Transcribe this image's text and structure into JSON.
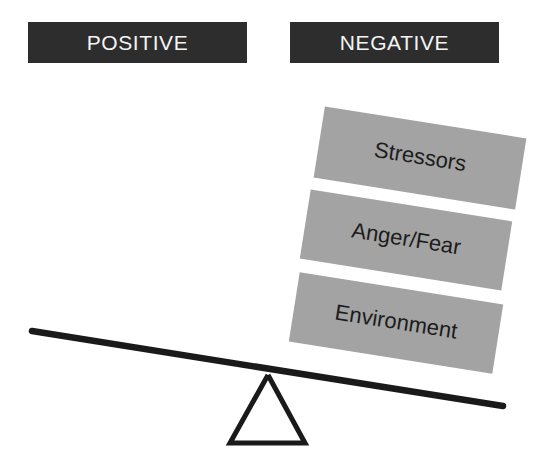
{
  "diagram": {
    "background_color": "#ffffff"
  },
  "headers": [
    {
      "id": "positive",
      "label": "POSITIVE",
      "background_color": "#2d2d2d",
      "text_color": "#f4f4f4"
    },
    {
      "id": "negative",
      "label": "NEGATIVE",
      "background_color": "#2d2d2d",
      "text_color": "#f4f4f4"
    }
  ],
  "weights": {
    "side": "negative",
    "block_color": "#a3a3a3",
    "text_color": "#1c1c1c",
    "rotation_degrees": 9,
    "items": [
      {
        "id": "stressors",
        "label": "Stressors"
      },
      {
        "id": "anger-fear",
        "label": "Anger/Fear"
      },
      {
        "id": "environment",
        "label": "Environment"
      }
    ]
  },
  "seesaw": {
    "stroke_color": "#1a1a1a",
    "beam": {
      "x1": 32,
      "y1": 331,
      "x2": 503,
      "y2": 406
    },
    "fulcrum": {
      "apex_x": 268,
      "apex_y": 375,
      "base_left_x": 230,
      "base_right_x": 305,
      "base_y": 443
    },
    "tilt": "negative-side-down"
  }
}
